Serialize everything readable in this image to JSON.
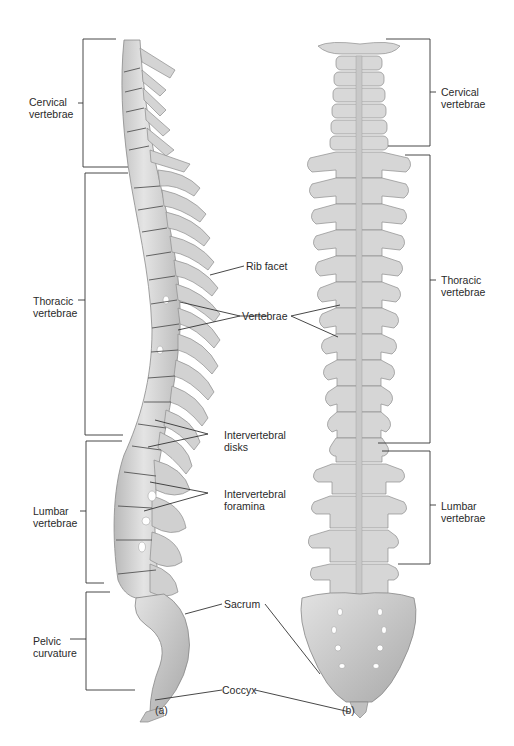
{
  "figure": {
    "views": [
      {
        "id": "a",
        "caption": "(a)",
        "orientation": "lateral view"
      },
      {
        "id": "b",
        "caption": "(b)",
        "orientation": "posterior view"
      }
    ]
  },
  "left_regions": [
    {
      "line1": "Cervical",
      "line2": "vertebrae"
    },
    {
      "line1": "Thoracic",
      "line2": "vertebrae"
    },
    {
      "line1": "Lumbar",
      "line2": "vertebrae"
    },
    {
      "line1": "Pelvic",
      "line2": "curvature"
    }
  ],
  "right_regions": [
    {
      "line1": "Cervical",
      "line2": "vertebrae"
    },
    {
      "line1": "Thoracic",
      "line2": "vertebrae"
    },
    {
      "line1": "Lumbar",
      "line2": "vertebrae"
    }
  ],
  "center_labels": {
    "rib_facet": "Rib facet",
    "vertebrae": "Vertebrae",
    "intervertebral_disks": {
      "line1": "Intervertebral",
      "line2": "disks"
    },
    "intervertebral_foramina": {
      "line1": "Intervertebral",
      "line2": "foramina"
    },
    "sacrum": "Sacrum",
    "coccyx": "Coccyx"
  },
  "colors": {
    "bone": "#d9d9d9",
    "bone_shadow": "#a8a8a8",
    "bone_outline": "#8a8a8a",
    "disk_line": "#555555",
    "leader_line": "#333333",
    "text": "#2a2a2a"
  }
}
